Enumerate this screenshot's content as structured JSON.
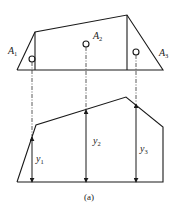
{
  "figure": {
    "caption": "(a)",
    "top": {
      "labels": [
        {
          "base": "A",
          "sub": "1"
        },
        {
          "base": "A",
          "sub": "2"
        },
        {
          "base": "A",
          "sub": "3"
        }
      ]
    },
    "bottom": {
      "labels": [
        {
          "base": "y",
          "sub": "1"
        },
        {
          "base": "y",
          "sub": "2"
        },
        {
          "base": "y",
          "sub": "3"
        }
      ]
    },
    "colors": {
      "line": "#1a1a1a",
      "background": "#ffffff"
    }
  }
}
